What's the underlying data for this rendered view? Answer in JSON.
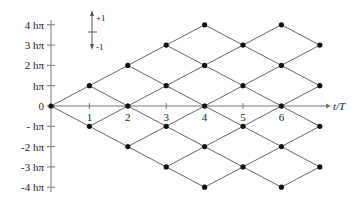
{
  "diagram": {
    "x_axis": {
      "label": "t/T",
      "ticks": [
        "1",
        "2",
        "3",
        "4",
        "5",
        "6"
      ]
    },
    "y_axis": {
      "tick_labels": [
        "4 hπ",
        "3 hπ",
        "2 hπ",
        "hπ",
        "0",
        "- hπ",
        "-2  hπ",
        "-3  hπ",
        "-4  hπ"
      ],
      "tick_values": [
        4,
        3,
        2,
        1,
        0,
        -1,
        -2,
        -3,
        -4
      ]
    },
    "legend": {
      "up_label": "+1",
      "down_label": "-1"
    },
    "lattice": {
      "t_max": 7,
      "k_max": 4,
      "nodes": [
        [
          0,
          0
        ],
        [
          1,
          1
        ],
        [
          1,
          -1
        ],
        [
          2,
          2
        ],
        [
          2,
          0
        ],
        [
          2,
          -2
        ],
        [
          3,
          3
        ],
        [
          3,
          1
        ],
        [
          3,
          -1
        ],
        [
          3,
          -3
        ],
        [
          4,
          4
        ],
        [
          4,
          2
        ],
        [
          4,
          0
        ],
        [
          4,
          -2
        ],
        [
          4,
          -4
        ],
        [
          5,
          3
        ],
        [
          5,
          1
        ],
        [
          5,
          -1
        ],
        [
          5,
          -3
        ],
        [
          6,
          4
        ],
        [
          6,
          2
        ],
        [
          6,
          0
        ],
        [
          6,
          -2
        ],
        [
          6,
          -4
        ],
        [
          7,
          3
        ],
        [
          7,
          1
        ],
        [
          7,
          -1
        ],
        [
          7,
          -3
        ]
      ]
    },
    "colors": {
      "line": "#555555",
      "node": "#111111",
      "axis": "#777777",
      "text": "#222222"
    }
  }
}
